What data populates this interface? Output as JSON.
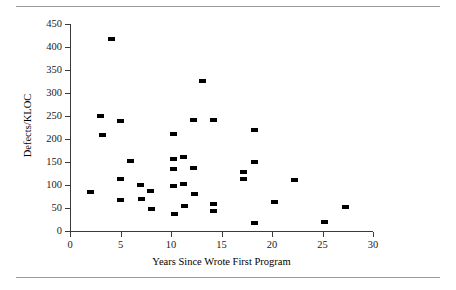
{
  "figure": {
    "has_top_rule": true,
    "has_bottom_rule": true,
    "rule_color": "#9a9a9a",
    "background": "#ffffff"
  },
  "chart_data": {
    "type": "scatter",
    "title": "",
    "xlabel": "Years Since Wrote First Program",
    "ylabel": "Defects/KLOC",
    "xlim": [
      0,
      30
    ],
    "ylim": [
      0,
      450
    ],
    "xticks": [
      0,
      5,
      10,
      15,
      20,
      25,
      30
    ],
    "yticks": [
      0,
      50,
      100,
      150,
      200,
      250,
      300,
      350,
      400,
      450
    ],
    "xtick_labels": [
      "0",
      "5",
      "10",
      "15",
      "20",
      "25",
      "30"
    ],
    "ytick_labels": [
      "0",
      "50",
      "100",
      "150",
      "200",
      "250",
      "300",
      "350",
      "400",
      "450"
    ],
    "grid": false,
    "legend": null,
    "marker": "filled-rectangle",
    "marker_color": "#000000",
    "series": [
      {
        "name": "Defects/KLOC vs Years Since Wrote First Program",
        "points": [
          [
            2.0,
            85
          ],
          [
            3.0,
            250
          ],
          [
            3.2,
            208
          ],
          [
            4.1,
            418
          ],
          [
            5.0,
            239
          ],
          [
            5.0,
            112
          ],
          [
            5.0,
            67
          ],
          [
            6.0,
            152
          ],
          [
            7.0,
            101
          ],
          [
            7.1,
            70
          ],
          [
            8.0,
            88
          ],
          [
            8.1,
            48
          ],
          [
            10.2,
            210
          ],
          [
            10.2,
            156
          ],
          [
            10.2,
            134
          ],
          [
            10.2,
            98
          ],
          [
            10.3,
            37
          ],
          [
            11.2,
            161
          ],
          [
            11.2,
            102
          ],
          [
            11.3,
            55
          ],
          [
            12.2,
            241
          ],
          [
            12.2,
            137
          ],
          [
            12.3,
            80
          ],
          [
            13.1,
            327
          ],
          [
            14.2,
            241
          ],
          [
            14.2,
            58
          ],
          [
            14.2,
            43
          ],
          [
            17.2,
            129
          ],
          [
            17.2,
            113
          ],
          [
            18.3,
            219
          ],
          [
            18.3,
            150
          ],
          [
            18.3,
            18
          ],
          [
            20.2,
            62
          ],
          [
            22.2,
            110
          ],
          [
            25.2,
            19
          ],
          [
            27.3,
            53
          ]
        ]
      }
    ]
  }
}
